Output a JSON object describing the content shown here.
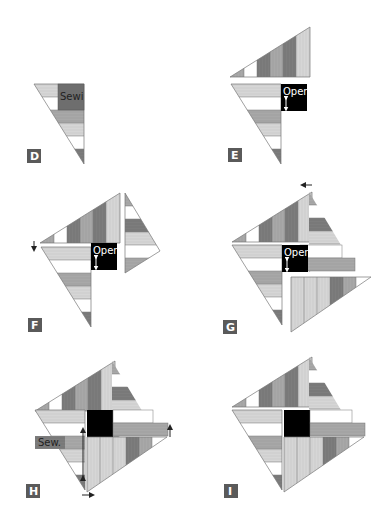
{
  "figure": {
    "type": "quilt-block assembly steps",
    "colors": {
      "dark": "#7f7f7f",
      "medium": "#a9a9a9",
      "light": "#d4d4d4",
      "white": "#ffffff",
      "center": "#000000",
      "outline": "#777777",
      "label_bg": "#5a5a5a",
      "label_fg": "#ffffff"
    },
    "panels": [
      {
        "id": "D",
        "label": "D",
        "note": "Sewi"
      },
      {
        "id": "E",
        "label": "E",
        "note": "Open"
      },
      {
        "id": "F",
        "label": "F",
        "note": "Open"
      },
      {
        "id": "G",
        "label": "G",
        "note": "Open"
      },
      {
        "id": "H",
        "label": "H",
        "note": "Sew."
      },
      {
        "id": "I",
        "label": "I",
        "note": ""
      }
    ]
  }
}
